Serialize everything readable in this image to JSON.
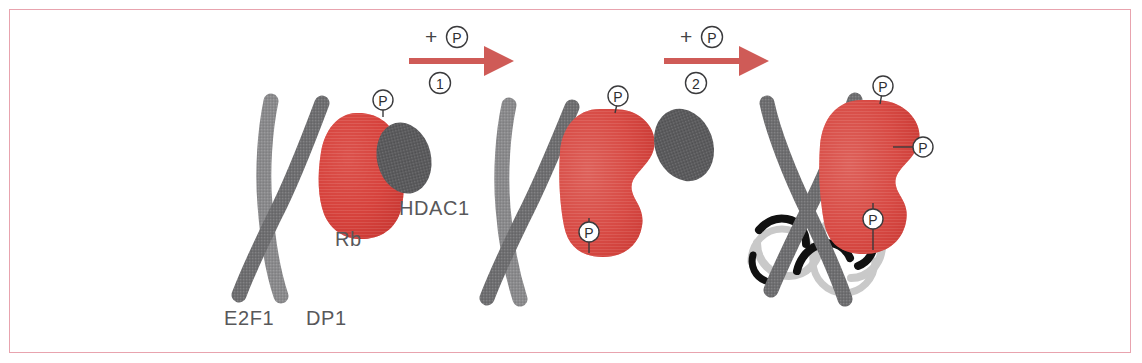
{
  "figure": {
    "border_color": "#e8a3ae",
    "background": "#ffffff"
  },
  "palette": {
    "rb_red": "#d6423c",
    "rb_red_dark": "#c02a26",
    "rb_red_light": "#e4716b",
    "protein_gray": "#6f6f71",
    "protein_gray_light": "#8d8d8f",
    "hdac_gray": "#5b5b5d",
    "dna_dark": "#111111",
    "dna_light": "#c9c9c9",
    "arrow_red": "#cf5b57",
    "label_gray": "#58585a",
    "p_outline": "#3a3a3c"
  },
  "labels": {
    "rb": "Rb",
    "hdac1": "HDAC1",
    "e2f1": "E2F1",
    "dp1": "DP1"
  },
  "arrows": [
    {
      "plus_p": "+",
      "p": "P",
      "step": "①"
    },
    {
      "plus_p": "+",
      "p": "P",
      "step": "②"
    }
  ],
  "phosphate_glyph": "P",
  "stages": [
    {
      "name": "stage-1-rb-hdac1-e2f1-dp1-complex",
      "components": [
        "E2F1",
        "DP1",
        "Rb",
        "HDAC1"
      ],
      "phosphate_count": 1
    },
    {
      "name": "stage-2-hdac1-released",
      "components": [
        "E2F1",
        "DP1",
        "Rb"
      ],
      "phosphate_count": 2
    },
    {
      "name": "stage-3-rb-released-dna-bound",
      "components": [
        "E2F1",
        "DP1",
        "DNA",
        "Rb"
      ],
      "phosphate_count": 3
    }
  ]
}
